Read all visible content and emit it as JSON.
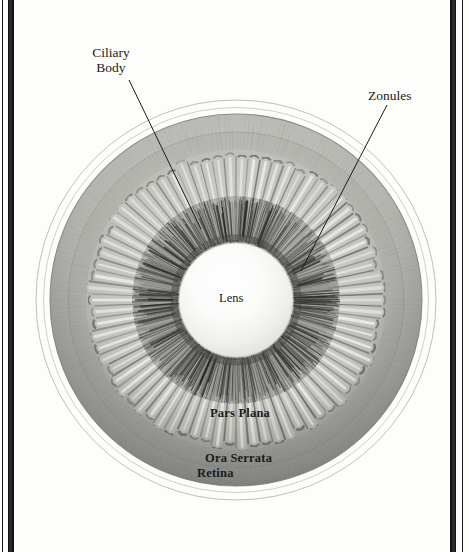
{
  "figure": {
    "kind": "anatomical-illustration",
    "view": "en face / posterior",
    "background_color": "#fdfdfc",
    "ink_color": "#1b1b1b"
  },
  "border": {
    "style": "double vertical rule",
    "thin_color": "#1a1a1a",
    "thick_color": "#222222"
  },
  "labels": {
    "ciliary_body": "Ciliary\nBody",
    "ciliary_body_line1": "Ciliary",
    "ciliary_body_line2": "Body",
    "zonules": "Zonules",
    "lens": "Lens",
    "pars_plana": "Pars Plana",
    "ora_serrata": "Ora Serrata",
    "retina": "Retina"
  },
  "structures": [
    {
      "name": "Lens",
      "style": "plain",
      "position": "center",
      "radius_px": 57
    },
    {
      "name": "Zonules",
      "style": "plain",
      "position": "ring",
      "radius_px": 92
    },
    {
      "name": "Ciliary Body",
      "style": "plain",
      "position": "ring",
      "radius_px": 128
    },
    {
      "name": "Pars Plana",
      "style": "bold",
      "position": "ring",
      "radius_px": 150
    },
    {
      "name": "Ora Serrata",
      "style": "bold",
      "position": "ring",
      "radius_px": 168
    },
    {
      "name": "Retina",
      "style": "bold",
      "position": "outer-ring",
      "radius_px": 186
    }
  ],
  "leaders": [
    {
      "from": "ciliary_body",
      "x1": 129,
      "y1": 80,
      "x2": 201,
      "y2": 229
    },
    {
      "from": "zonules",
      "x1": 387,
      "y1": 105,
      "x2": 301,
      "y2": 271
    }
  ],
  "geometry": {
    "center_x": 236,
    "center_y": 300,
    "outer_circle_r": 200,
    "second_circle_r": 192,
    "globe_r": 186,
    "lens_r": 57
  }
}
